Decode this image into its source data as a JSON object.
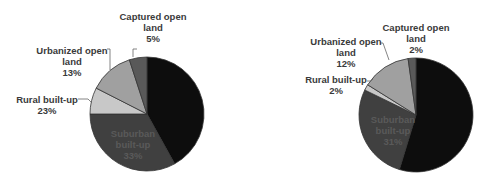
{
  "chart_data": [
    {
      "type": "pie",
      "title": "",
      "center": [
        147,
        114
      ],
      "radius": 57,
      "slices": [
        {
          "name": "Urban built-up",
          "label_visible": false,
          "value": 26,
          "start_deg": 0,
          "end_deg": 151,
          "color": "#0d0d0d"
        },
        {
          "name": "Suburban built-up",
          "label_lines": [
            "Suburban",
            "built-up"
          ],
          "value": 33,
          "value_label": "33%",
          "start_deg": 151,
          "end_deg": 270,
          "color": "#404040"
        },
        {
          "name": "Rural built-up",
          "label_lines": [
            "Rural built-up"
          ],
          "value": 23,
          "value_label": "23%",
          "start_deg": 270,
          "end_deg": 297,
          "color": "#c8c8c8"
        },
        {
          "name": "Urbanized open land",
          "label_lines": [
            "Urbanized open",
            "land"
          ],
          "value": 13,
          "value_label": "13%",
          "start_deg": 297,
          "end_deg": 342,
          "color": "#a0a0a0"
        },
        {
          "name": "Captured open land",
          "label_lines": [
            "Captured open",
            "land"
          ],
          "value": 5,
          "value_label": "5%",
          "start_deg": 342,
          "end_deg": 360,
          "color": "#595959"
        }
      ]
    },
    {
      "type": "pie",
      "title": "",
      "center": [
        173,
        115
      ],
      "radius": 57,
      "slices": [
        {
          "name": "Urban built-up",
          "label_visible": false,
          "value": 53,
          "start_deg": 0,
          "end_deg": 197,
          "color": "#0d0d0d"
        },
        {
          "name": "Suburban built-up",
          "label_lines": [
            "Suburban",
            "built-up"
          ],
          "value": 31,
          "value_label": "31%",
          "start_deg": 197,
          "end_deg": 296,
          "color": "#404040"
        },
        {
          "name": "Rural built-up",
          "label_lines": [
            "Rural built-up"
          ],
          "value": 2,
          "value_label": "2%",
          "start_deg": 296,
          "end_deg": 302,
          "color": "#c8c8c8"
        },
        {
          "name": "Urbanized open land",
          "label_lines": [
            "Urbanized open",
            "land"
          ],
          "value": 12,
          "value_label": "12%",
          "start_deg": 302,
          "end_deg": 352,
          "color": "#a0a0a0"
        },
        {
          "name": "Captured open land",
          "label_lines": [
            "Captured open",
            "land"
          ],
          "value": 2,
          "value_label": "2%",
          "start_deg": 352,
          "end_deg": 360,
          "color": "#595959"
        }
      ]
    }
  ],
  "labels": {
    "left": {
      "captured": {
        "l1": "Captured open",
        "l2": "land",
        "pct": "5%"
      },
      "urbanized": {
        "l1": "Urbanized open",
        "l2": "land",
        "pct": "13%"
      },
      "rural": {
        "l1": "Rural built-up",
        "pct": "23%"
      },
      "suburban": {
        "l1": "Suburban",
        "l2": "built-up",
        "pct": "33%"
      }
    },
    "right": {
      "captured": {
        "l1": "Captured open",
        "l2": "land",
        "pct": "2%"
      },
      "urbanized": {
        "l1": "Urbanized open",
        "l2": "land",
        "pct": "12%"
      },
      "rural": {
        "l1": "Rural built-up",
        "pct": "2%"
      },
      "suburban": {
        "l1": "Suburban",
        "l2": "built-up",
        "pct": "31%"
      }
    }
  }
}
